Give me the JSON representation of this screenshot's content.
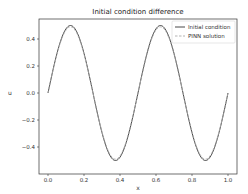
{
  "chart_data": {
    "type": "line",
    "title": "Initial condition difference",
    "xlabel": "x",
    "ylabel": "u",
    "xlim": [
      -0.05,
      1.05
    ],
    "ylim": [
      -0.55,
      0.55
    ],
    "xticks": [
      0.0,
      0.2,
      0.4,
      0.6,
      0.8,
      1.0
    ],
    "xtick_labels": [
      "0.0",
      "0.2",
      "0.4",
      "0.6",
      "0.8",
      "1.0"
    ],
    "yticks": [
      -0.4,
      -0.2,
      0.0,
      0.2,
      0.4
    ],
    "ytick_labels": [
      "−0.4",
      "−0.2",
      "0.0",
      "0.2",
      "0.4"
    ],
    "grid": false,
    "legend_position": "upper right",
    "x": [
      0.0,
      0.0625,
      0.125,
      0.1875,
      0.25,
      0.3125,
      0.375,
      0.4375,
      0.5,
      0.5625,
      0.625,
      0.6875,
      0.75,
      0.8125,
      0.875,
      0.9375,
      1.0
    ],
    "series": [
      {
        "name": "Initial condition",
        "style": "solid",
        "color": "#333333",
        "values": [
          0.0,
          0.354,
          0.5,
          0.354,
          0.0,
          -0.354,
          -0.5,
          -0.354,
          0.0,
          0.354,
          0.5,
          0.354,
          0.0,
          -0.354,
          -0.5,
          -0.354,
          0.0
        ]
      },
      {
        "name": "PINN solution",
        "style": "dashed",
        "color": "#999999",
        "values": [
          0.0,
          0.35,
          0.49,
          0.35,
          0.0,
          -0.35,
          -0.49,
          -0.35,
          0.0,
          0.35,
          0.49,
          0.35,
          0.0,
          -0.35,
          -0.49,
          -0.35,
          0.0
        ]
      }
    ]
  },
  "legend": {
    "items": [
      {
        "label": "Initial condition"
      },
      {
        "label": "PINN solution"
      }
    ]
  }
}
